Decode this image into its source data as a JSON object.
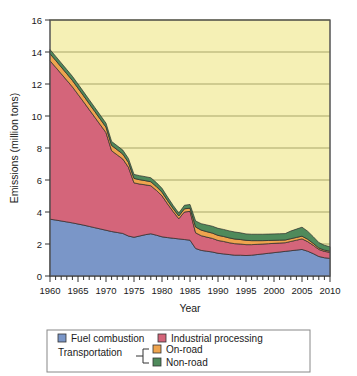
{
  "chart_data": {
    "type": "area",
    "stacked": true,
    "title": "",
    "xlabel": "Year",
    "ylabel": "Emissions (million tons)",
    "xlim": [
      1960,
      2010
    ],
    "ylim": [
      0,
      16
    ],
    "ytick_values": [
      0,
      2,
      4,
      6,
      8,
      10,
      12,
      14,
      16
    ],
    "ytick_labels": [
      "0",
      "2",
      "4",
      "6",
      "8",
      "10",
      "12",
      "14",
      "16"
    ],
    "xtick_values": [
      1960,
      1965,
      1970,
      1975,
      1980,
      1985,
      1990,
      1995,
      2000,
      2005,
      2010
    ],
    "xtick_labels": [
      "1960",
      "1965",
      "1970",
      "1975",
      "1980",
      "1985",
      "1990",
      "1995",
      "2000",
      "2005",
      "2010"
    ],
    "minor_xtick_interval": 1,
    "grid": "horizontal",
    "plot_background": "#f5f0b5",
    "legend_position": "below",
    "x": [
      1960,
      1961,
      1962,
      1963,
      1964,
      1965,
      1966,
      1967,
      1968,
      1969,
      1970,
      1971,
      1972,
      1973,
      1974,
      1975,
      1976,
      1977,
      1978,
      1979,
      1980,
      1981,
      1982,
      1983,
      1984,
      1985,
      1986,
      1987,
      1988,
      1989,
      1990,
      1991,
      1992,
      1993,
      1994,
      1995,
      1996,
      1997,
      1998,
      1999,
      2000,
      2001,
      2002,
      2003,
      2004,
      2005,
      2006,
      2007,
      2008,
      2009,
      2010
    ],
    "series": [
      {
        "name": "Fuel combustion",
        "color": "#7a96c8",
        "values": [
          3.55,
          3.5,
          3.44,
          3.38,
          3.32,
          3.25,
          3.18,
          3.1,
          3.02,
          2.94,
          2.86,
          2.78,
          2.72,
          2.66,
          2.5,
          2.42,
          2.5,
          2.58,
          2.64,
          2.55,
          2.45,
          2.4,
          2.36,
          2.32,
          2.28,
          2.24,
          1.72,
          1.6,
          1.55,
          1.5,
          1.42,
          1.38,
          1.34,
          1.3,
          1.3,
          1.28,
          1.3,
          1.34,
          1.38,
          1.42,
          1.46,
          1.5,
          1.54,
          1.58,
          1.62,
          1.66,
          1.55,
          1.4,
          1.22,
          1.14,
          1.1
        ]
      },
      {
        "name": "Industrial processing",
        "color": "#d4657a",
        "values": [
          9.9,
          9.55,
          9.2,
          8.85,
          8.5,
          8.1,
          7.7,
          7.3,
          6.9,
          6.5,
          6.1,
          5.05,
          4.85,
          4.65,
          4.3,
          3.4,
          3.25,
          3.12,
          3.0,
          2.8,
          2.56,
          2.1,
          1.66,
          1.26,
          1.72,
          1.8,
          0.98,
          0.92,
          0.88,
          0.85,
          0.8,
          0.78,
          0.74,
          0.72,
          0.7,
          0.68,
          0.66,
          0.64,
          0.62,
          0.6,
          0.58,
          0.56,
          0.54,
          0.58,
          0.62,
          0.66,
          0.6,
          0.52,
          0.44,
          0.4,
          0.38
        ]
      },
      {
        "name": "On-road",
        "color": "#efa44e",
        "values": [
          0.44,
          0.43,
          0.42,
          0.41,
          0.4,
          0.39,
          0.38,
          0.37,
          0.36,
          0.35,
          0.34,
          0.33,
          0.32,
          0.31,
          0.3,
          0.28,
          0.27,
          0.26,
          0.25,
          0.24,
          0.23,
          0.21,
          0.19,
          0.17,
          0.2,
          0.2,
          0.36,
          0.35,
          0.34,
          0.33,
          0.32,
          0.31,
          0.3,
          0.29,
          0.28,
          0.27,
          0.25,
          0.23,
          0.21,
          0.2,
          0.19,
          0.18,
          0.17,
          0.17,
          0.17,
          0.17,
          0.15,
          0.12,
          0.09,
          0.08,
          0.07
        ]
      },
      {
        "name": "Non-road",
        "color": "#4f8a5b",
        "values": [
          0.26,
          0.26,
          0.26,
          0.26,
          0.26,
          0.26,
          0.25,
          0.25,
          0.25,
          0.25,
          0.25,
          0.25,
          0.25,
          0.25,
          0.25,
          0.25,
          0.25,
          0.25,
          0.25,
          0.25,
          0.24,
          0.22,
          0.2,
          0.18,
          0.22,
          0.23,
          0.38,
          0.4,
          0.42,
          0.43,
          0.44,
          0.44,
          0.44,
          0.44,
          0.42,
          0.4,
          0.4,
          0.4,
          0.4,
          0.4,
          0.4,
          0.4,
          0.4,
          0.48,
          0.52,
          0.56,
          0.5,
          0.42,
          0.34,
          0.3,
          0.28
        ]
      }
    ],
    "legend": {
      "group_label": "Transportation",
      "entries": [
        {
          "label": "Fuel combustion",
          "color": "#7a96c8"
        },
        {
          "label": "Industrial processing",
          "color": "#d4657a"
        },
        {
          "label": "On-road",
          "color": "#efa44e"
        },
        {
          "label": "Non-road",
          "color": "#4f8a5b"
        }
      ]
    }
  }
}
